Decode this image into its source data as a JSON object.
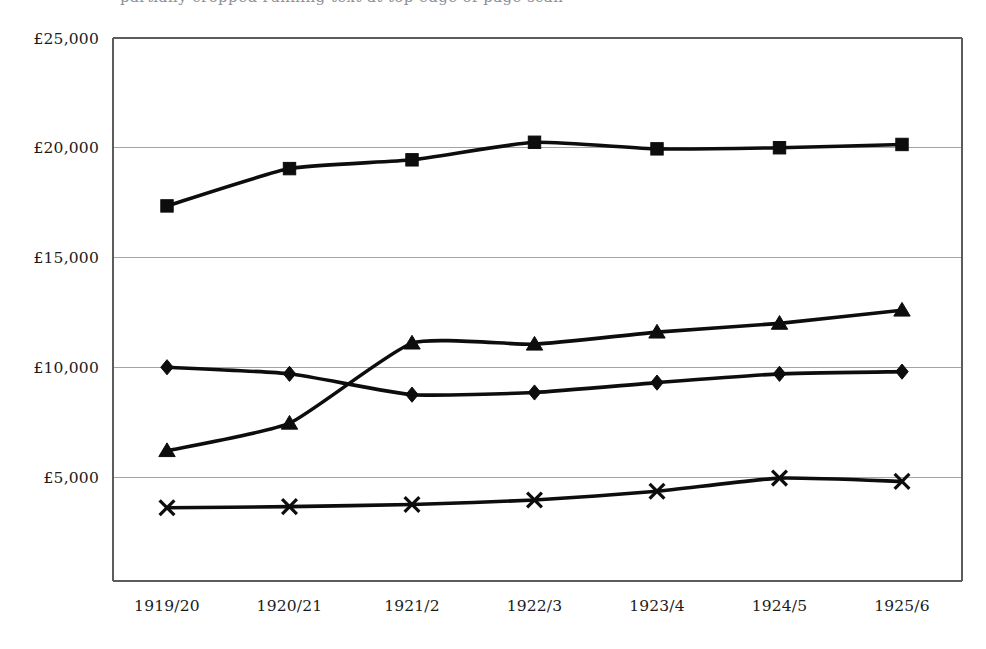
{
  "caption": {
    "clipped_text_top": "partially cropped running text at top edge of page scan"
  },
  "chart_data": {
    "type": "line",
    "title": "",
    "subtitle": "",
    "xlabel": "",
    "ylabel": "",
    "currency_symbol": "£",
    "categories": [
      "1919/20",
      "1920/21",
      "1921/2",
      "1922/3",
      "1923/4",
      "1924/5",
      "1925/6"
    ],
    "ylim": [
      0,
      25000
    ],
    "ytick_values": [
      5000,
      10000,
      15000,
      20000,
      25000
    ],
    "ytick_labels": [
      "£5,000",
      "£10,000",
      "£15,000",
      "£20,000",
      "£25,000"
    ],
    "grid": "horizontal",
    "legend": "none",
    "series": [
      {
        "name": "square-series",
        "marker": "square",
        "values": [
          17350,
          19050,
          19450,
          20250,
          19950,
          20000,
          20150
        ]
      },
      {
        "name": "triangle-series",
        "marker": "triangle",
        "values": [
          6200,
          7450,
          11100,
          11050,
          11600,
          12000,
          12600
        ]
      },
      {
        "name": "diamond-series",
        "marker": "diamond",
        "values": [
          10000,
          9700,
          8750,
          8850,
          9300,
          9700,
          9800
        ]
      },
      {
        "name": "cross-series",
        "marker": "cross",
        "values": [
          3600,
          3650,
          3750,
          3950,
          4350,
          4950,
          4800
        ]
      }
    ]
  },
  "colors": {
    "ink": "#0d0d0d",
    "grid": "#9a9a9a",
    "axis": "#5c5c5c",
    "background": "#ffffff"
  }
}
